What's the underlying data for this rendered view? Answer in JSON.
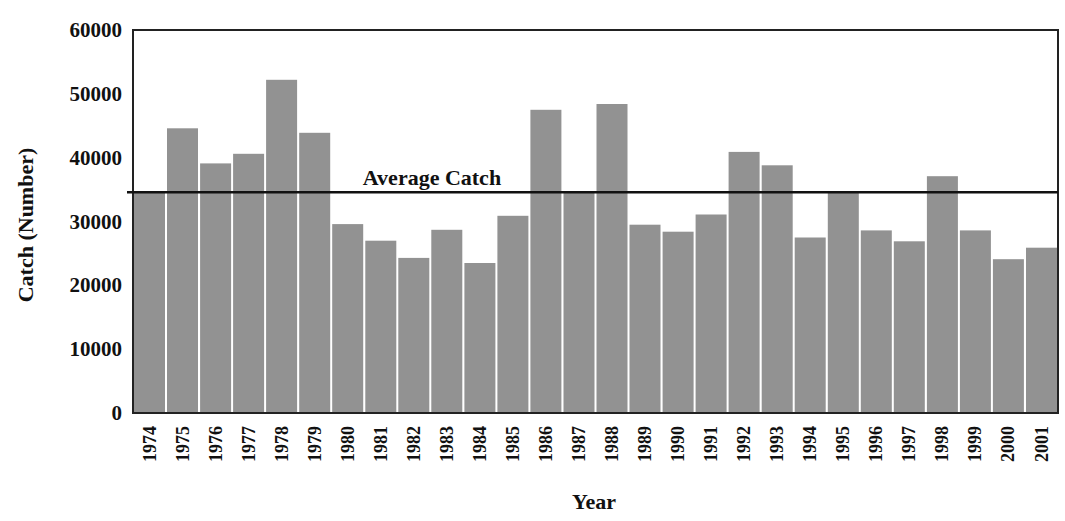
{
  "chart_data": {
    "type": "bar",
    "title": "",
    "xlabel": "Year",
    "ylabel": "Catch (Number)",
    "ylim": [
      0,
      60000
    ],
    "yticks": [
      0,
      10000,
      20000,
      30000,
      40000,
      50000,
      60000
    ],
    "ytick_labels": [
      "0",
      "10000",
      "20000",
      "30000",
      "40000",
      "50000",
      "60000"
    ],
    "grid": false,
    "legend": null,
    "categories": [
      "1974",
      "1975",
      "1976",
      "1977",
      "1978",
      "1979",
      "1980",
      "1981",
      "1982",
      "1983",
      "1984",
      "1985",
      "1986",
      "1987",
      "1988",
      "1989",
      "1990",
      "1991",
      "1992",
      "1993",
      "1994",
      "1995",
      "1996",
      "1997",
      "1998",
      "1999",
      "2000",
      "2001"
    ],
    "values": [
      34600,
      44600,
      39100,
      40600,
      52200,
      43900,
      29600,
      27000,
      24300,
      28700,
      23500,
      30900,
      47500,
      34600,
      48400,
      29500,
      28400,
      31100,
      40900,
      38800,
      27500,
      34600,
      28600,
      26900,
      37100,
      28600,
      24100,
      25900
    ],
    "reference_line": {
      "label": "Average Catch",
      "value": 34600
    },
    "colors": {
      "bar": "#929292",
      "bar_gap": "#ffffff",
      "axis": "#222222",
      "line": "#111111"
    }
  }
}
